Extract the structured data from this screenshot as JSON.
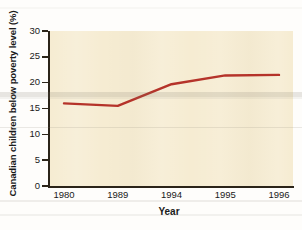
{
  "chart_data": {
    "type": "line",
    "title": "",
    "xlabel": "Year",
    "ylabel": "Canadian children below poverty level (%)",
    "categories": [
      "1980",
      "1989",
      "1994",
      "1995",
      "1996"
    ],
    "values": [
      16.0,
      15.5,
      19.7,
      21.4,
      21.5
    ],
    "series": [
      {
        "name": "Canadian children below poverty level",
        "values": [
          16.0,
          15.5,
          19.7,
          21.4,
          21.5
        ],
        "color": "#b5332a"
      }
    ],
    "x_tick_labels": [
      "1980",
      "1989",
      "1994",
      "1995",
      "1996"
    ],
    "y_tick_labels": [
      "0",
      "5",
      "10",
      "15",
      "20",
      "25",
      "30"
    ],
    "y_tick_values": [
      0,
      5,
      10,
      15,
      20,
      25,
      30
    ],
    "ylim": [
      0,
      30
    ],
    "grid": false,
    "legend": "none",
    "plot_background_color": "#f6ecd2",
    "axis_color": "#2b2419",
    "line_color": "#b5332a"
  },
  "axes": {
    "y_title": "Canadian children below poverty level (%)",
    "x_title": "Year"
  }
}
